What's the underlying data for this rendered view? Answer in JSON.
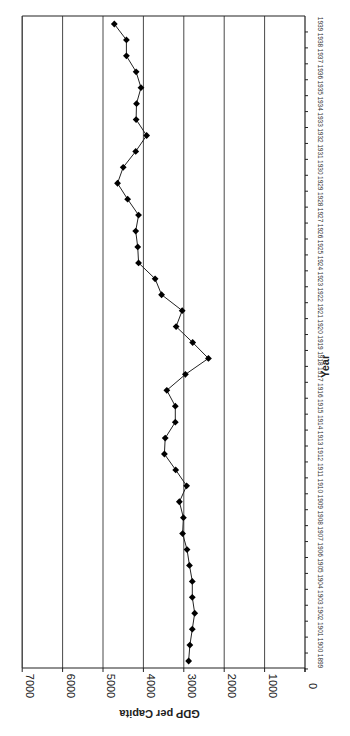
{
  "chart_data": {
    "type": "line",
    "title": "",
    "xlabel": "Year",
    "ylabel": "GDP per Capita",
    "ylim": [
      0,
      7000
    ],
    "yticks": [
      0,
      1000,
      2000,
      3000,
      4000,
      5000,
      6000,
      7000
    ],
    "grid": true,
    "legend": null,
    "orientation_note": "figure is rotated 90 degrees clockwise on the page",
    "marker": "diamond",
    "x": [
      1899,
      1900,
      1901,
      1902,
      1903,
      1904,
      1905,
      1906,
      1907,
      1908,
      1909,
      1910,
      1911,
      1912,
      1913,
      1914,
      1915,
      1916,
      1917,
      1918,
      1919,
      1920,
      1921,
      1922,
      1923,
      1924,
      1925,
      1926,
      1927,
      1928,
      1929,
      1930,
      1931,
      1932,
      1933,
      1934,
      1935,
      1936,
      1937,
      1938,
      1939
    ],
    "series": [
      {
        "name": "GDP per Capita",
        "values": [
          2880,
          2850,
          2790,
          2730,
          2790,
          2790,
          2860,
          2920,
          3030,
          3010,
          3110,
          2930,
          3200,
          3480,
          3460,
          3210,
          3210,
          3420,
          2960,
          2390,
          2780,
          3190,
          3040,
          3550,
          3710,
          4120,
          4140,
          4190,
          4120,
          4390,
          4640,
          4500,
          4190,
          3920,
          4180,
          4170,
          4060,
          4180,
          4420,
          4420,
          4720
        ]
      }
    ]
  },
  "labels": {
    "ylabel": "GDP per Capita",
    "xlabel": "Year"
  }
}
